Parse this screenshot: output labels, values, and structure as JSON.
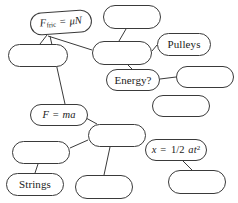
{
  "diagram": {
    "type": "concept-map",
    "background_color": "#ffffff",
    "stroke_color": "#3a3a3a",
    "text_color": "#1a1a1a",
    "nodes": [
      {
        "id": "f-fric",
        "label": "Ffric = μN",
        "label_parts": {
          "var1": "F",
          "subscript": "fric",
          "equals": " = ",
          "greek": "μ",
          "var2": "N"
        },
        "filled": true,
        "x": 30,
        "y": 11,
        "w": 62,
        "h": 23,
        "rotate": -4
      },
      {
        "id": "empty-top-center",
        "label": "",
        "filled": false,
        "x": 103,
        "y": 5,
        "w": 58,
        "h": 24,
        "rotate": 0
      },
      {
        "id": "empty-left-upper",
        "label": "",
        "filled": false,
        "x": 8,
        "y": 44,
        "w": 60,
        "h": 23,
        "rotate": 0
      },
      {
        "id": "empty-center",
        "label": "",
        "filled": false,
        "x": 92,
        "y": 41,
        "w": 60,
        "h": 24,
        "rotate": 0
      },
      {
        "id": "pulleys",
        "label": "Pulleys",
        "filled": true,
        "x": 157,
        "y": 33,
        "w": 54,
        "h": 23,
        "rotate": 0
      },
      {
        "id": "energy",
        "label": "Energy?",
        "filled": true,
        "x": 106,
        "y": 69,
        "w": 54,
        "h": 22,
        "rotate": 0
      },
      {
        "id": "empty-right-upper",
        "label": "",
        "filled": false,
        "x": 176,
        "y": 66,
        "w": 58,
        "h": 22,
        "rotate": 0
      },
      {
        "id": "empty-right-lower",
        "label": "",
        "filled": false,
        "x": 152,
        "y": 95,
        "w": 58,
        "h": 22,
        "rotate": 0
      },
      {
        "id": "f-ma",
        "label": "F = ma",
        "label_parts": {
          "var1": "F",
          "equals": " = ",
          "var2": "ma"
        },
        "filled": true,
        "x": 30,
        "y": 104,
        "w": 58,
        "h": 22,
        "rotate": 0
      },
      {
        "id": "empty-mid-center",
        "label": "",
        "filled": false,
        "x": 88,
        "y": 124,
        "w": 58,
        "h": 23,
        "rotate": 0
      },
      {
        "id": "empty-left-lower",
        "label": "",
        "filled": false,
        "x": 12,
        "y": 141,
        "w": 58,
        "h": 23,
        "rotate": 0
      },
      {
        "id": "kinematics",
        "label": "x = 1/2 at2",
        "label_parts": {
          "var1": "x",
          "equals": " = ",
          "fraction": "1/2 ",
          "var2": "at",
          "superscript": "2"
        },
        "filled": true,
        "x": 145,
        "y": 139,
        "w": 62,
        "h": 22,
        "rotate": 0
      },
      {
        "id": "strings",
        "label": "Strings",
        "filled": true,
        "x": 6,
        "y": 173,
        "w": 58,
        "h": 23,
        "rotate": 0
      },
      {
        "id": "empty-bottom-center",
        "label": "",
        "filled": false,
        "x": 75,
        "y": 175,
        "w": 58,
        "h": 24,
        "rotate": 0
      },
      {
        "id": "empty-bottom-right",
        "label": "",
        "filled": false,
        "x": 168,
        "y": 170,
        "w": 58,
        "h": 24,
        "rotate": 0
      }
    ],
    "links": [
      {
        "from": "f-fric",
        "to": "empty-left-upper",
        "x1": 47,
        "y1": 35,
        "x2": 40,
        "y2": 44
      },
      {
        "from": "f-fric",
        "to": "empty-center",
        "x1": 48,
        "y1": 36,
        "x2": 92,
        "y2": 50
      },
      {
        "from": "f-fric",
        "to": "f-ma",
        "x1": 50,
        "y1": 36,
        "x2": 65,
        "y2": 104
      },
      {
        "from": "empty-top-center",
        "to": "empty-center",
        "x1": 126,
        "y1": 29,
        "x2": 119,
        "y2": 41
      },
      {
        "from": "empty-center",
        "to": "pulleys",
        "x1": 152,
        "y1": 51,
        "x2": 157,
        "y2": 45
      },
      {
        "from": "empty-center",
        "to": "energy",
        "x1": 128,
        "y1": 65,
        "x2": 132,
        "y2": 69
      },
      {
        "from": "energy",
        "to": "empty-right-upper",
        "x1": 160,
        "y1": 79,
        "x2": 176,
        "y2": 77
      },
      {
        "from": "f-ma",
        "to": "empty-mid-center",
        "x1": 86,
        "y1": 118,
        "x2": 97,
        "y2": 124
      },
      {
        "from": "empty-mid-center",
        "to": "empty-left-lower",
        "x1": 88,
        "y1": 140,
        "x2": 70,
        "y2": 148
      },
      {
        "from": "empty-mid-center",
        "to": "empty-bottom-center",
        "x1": 110,
        "y1": 147,
        "x2": 104,
        "y2": 175
      },
      {
        "from": "empty-left-lower",
        "to": "strings",
        "x1": 38,
        "y1": 164,
        "x2": 35,
        "y2": 173
      },
      {
        "from": "kinematics",
        "to": "empty-bottom-right",
        "x1": 183,
        "y1": 161,
        "x2": 192,
        "y2": 170
      }
    ]
  }
}
